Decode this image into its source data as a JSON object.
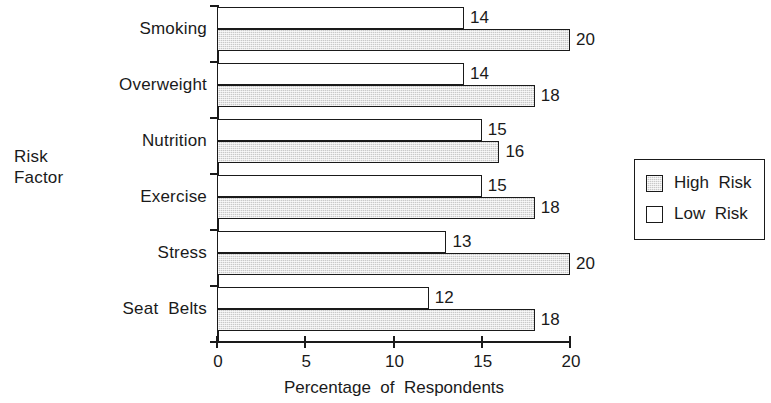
{
  "chart": {
    "type": "bar",
    "orientation": "horizontal",
    "xlabel": "Percentage  of  Respondents",
    "ylabel": "Risk\nFactor",
    "xlim": [
      0,
      20
    ],
    "xticks": [
      "0",
      "5",
      "10",
      "15",
      "20"
    ],
    "xtick_values": [
      0,
      5,
      10,
      15,
      20
    ],
    "grid": false,
    "legend_position": "right",
    "colors": {
      "high_risk": "#c9c9c9",
      "low_risk": "#ffffff",
      "axis": "#1a1a1a"
    }
  },
  "chart_data": {
    "type": "bar",
    "title": "",
    "subtitle": "",
    "xlabel": "Percentage  of  Respondents",
    "ylabel": "Risk Factor",
    "xlim": [
      0,
      20
    ],
    "categories": [
      "Smoking",
      "Overweight",
      "Nutrition",
      "Exercise",
      "Stress",
      "Seat  Belts"
    ],
    "series": [
      {
        "name": "High Risk",
        "values": [
          20,
          18,
          16,
          18,
          20,
          18
        ]
      },
      {
        "name": "Low Risk",
        "values": [
          14,
          14,
          15,
          15,
          13,
          12
        ]
      }
    ],
    "xticks": [
      0,
      5,
      10,
      15,
      20
    ],
    "grid": false,
    "legend_position": "right"
  },
  "legend": {
    "entries": [
      {
        "key": "high",
        "label": "High  Risk"
      },
      {
        "key": "low",
        "label": "Low  Risk"
      }
    ]
  }
}
